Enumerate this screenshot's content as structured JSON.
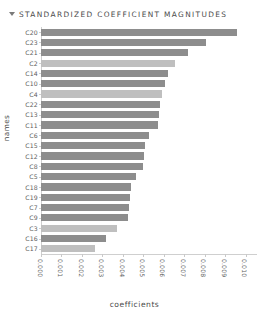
{
  "header": {
    "toggle_icon": "collapse-triangle-icon",
    "title": "STANDARDIZED COEFFICIENT MAGNITUDES"
  },
  "colors": {
    "bar_dark": "#8d8d8d",
    "bar_light": "#bfbfbf",
    "axis": "#cfcfcf",
    "text": "#5d5d5d",
    "title_text": "#4a4a4a",
    "background": "#ffffff"
  },
  "chart_data": {
    "type": "bar",
    "orientation": "horizontal",
    "title": "STANDARDIZED COEFFICIENT MAGNITUDES",
    "xlabel": "coefficients",
    "ylabel": "names",
    "xlim": [
      0.0,
      0.0105
    ],
    "grid": false,
    "legend": null,
    "xticks": [
      "0.000",
      "0.001",
      "0.002",
      "0.003",
      "0.004",
      "0.005",
      "0.006",
      "0.007",
      "0.008",
      "0.009",
      "0.010"
    ],
    "xtick_values": [
      0.0,
      0.001,
      0.002,
      0.003,
      0.004,
      0.005,
      0.006,
      0.007,
      0.008,
      0.009,
      0.01
    ],
    "xtick_rotation": 90,
    "categories": [
      "C20",
      "C23",
      "C21",
      "C2",
      "C14",
      "C10",
      "C4",
      "C22",
      "C13",
      "C11",
      "C6",
      "C15",
      "C12",
      "C8",
      "C5",
      "C18",
      "C19",
      "C7",
      "C9",
      "C3",
      "C16",
      "C17"
    ],
    "values": [
      0.00955,
      0.00805,
      0.0072,
      0.00655,
      0.0062,
      0.00605,
      0.0059,
      0.0058,
      0.00575,
      0.0057,
      0.00525,
      0.0051,
      0.00505,
      0.005,
      0.00465,
      0.0044,
      0.00435,
      0.0043,
      0.00425,
      0.0037,
      0.00315,
      0.00265
    ],
    "bar_shades": [
      "dark",
      "dark",
      "dark",
      "light",
      "dark",
      "dark",
      "light",
      "dark",
      "dark",
      "dark",
      "dark",
      "dark",
      "dark",
      "dark",
      "dark",
      "dark",
      "dark",
      "dark",
      "dark",
      "light",
      "dark",
      "light"
    ]
  }
}
